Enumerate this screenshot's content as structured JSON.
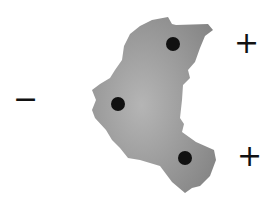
{
  "diagram": {
    "shape": {
      "fill_light": "#b8b8b8",
      "fill_dark": "#8a8a8a"
    },
    "dots": [
      {
        "cx": 173,
        "cy": 44,
        "r": 7
      },
      {
        "cx": 118,
        "cy": 104,
        "r": 7
      },
      {
        "cx": 185,
        "cy": 158,
        "r": 7
      }
    ],
    "signs": {
      "minus": "−",
      "plus_top": "+",
      "plus_bottom": "+"
    }
  }
}
